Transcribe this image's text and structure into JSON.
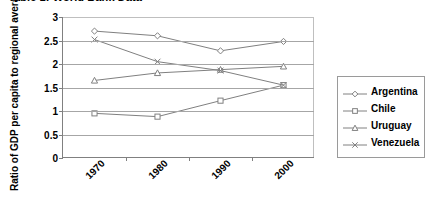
{
  "figure": {
    "title": "Table 1: World Bank Data"
  },
  "legend": {
    "position": "right",
    "entries": [
      {
        "label": "Argentina",
        "marker": "diamond-marker",
        "color": "#808080"
      },
      {
        "label": "Chile",
        "marker": "square-marker",
        "color": "#808080"
      },
      {
        "label": "Uruguay",
        "marker": "triangle-marker",
        "color": "#808080"
      },
      {
        "label": "Venezuela",
        "marker": "cross-marker",
        "color": "#808080"
      }
    ]
  },
  "chart_data": {
    "type": "line",
    "title": "Table 1: World Bank Data",
    "xlabel": "",
    "ylabel": "Ratio of GDP per capita to regional average",
    "categories": [
      "1970",
      "1980",
      "1990",
      "2000"
    ],
    "ylim": [
      0,
      3
    ],
    "yticks": [
      0,
      0.5,
      1,
      1.5,
      2,
      2.5,
      3
    ],
    "ytick_labels": [
      "0",
      "0.5",
      "1",
      "1.5",
      "2",
      "2.5",
      "3"
    ],
    "grid": "horizontal",
    "legend_position": "right",
    "series": [
      {
        "name": "Argentina",
        "marker": "diamond",
        "color": "#808080",
        "values": [
          2.7,
          2.6,
          2.28,
          2.48
        ]
      },
      {
        "name": "Chile",
        "marker": "square",
        "color": "#808080",
        "values": [
          0.95,
          0.88,
          1.22,
          1.55
        ]
      },
      {
        "name": "Uruguay",
        "marker": "triangle",
        "color": "#808080",
        "values": [
          1.65,
          1.81,
          1.88,
          1.95
        ]
      },
      {
        "name": "Venezuela",
        "marker": "cross",
        "color": "#808080",
        "values": [
          2.52,
          2.05,
          1.86,
          1.55
        ]
      }
    ]
  }
}
